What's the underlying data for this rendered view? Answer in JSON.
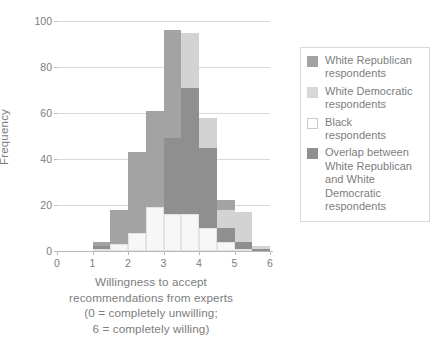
{
  "chart_data": {
    "type": "bar",
    "title": "",
    "subtitle": "",
    "xlabel": "Willingness to accept recommendations from experts (0 = completely unwilling; 6 = completely willing)",
    "ylabel": "Frequency",
    "xlim": [
      0,
      6
    ],
    "ylim": [
      0,
      100
    ],
    "xticks": [
      "0",
      "1",
      "2",
      "3",
      "4",
      "5",
      "6"
    ],
    "yticks": [
      "0",
      "20",
      "40",
      "60",
      "80",
      "100"
    ],
    "grid": true,
    "legend_position": "right",
    "bin_width": 0.5,
    "bin_starts": [
      1.0,
      1.5,
      2.0,
      2.5,
      3.0,
      3.5,
      4.0,
      4.5,
      5.0,
      5.5
    ],
    "series": [
      {
        "name": "White Republican respondents",
        "color": "#a3a3a3",
        "values": [
          4,
          18,
          43,
          61,
          96,
          71,
          58,
          22,
          4,
          1
        ]
      },
      {
        "name": "White Democratic respondents",
        "color": "#d3d3d3",
        "values": [
          2,
          3,
          8,
          19,
          49,
          95,
          58,
          18,
          17,
          2
        ]
      },
      {
        "name": "Black respondents",
        "color": "#f7f7f7",
        "values": [
          1,
          3,
          8,
          19,
          16,
          16,
          10,
          4,
          1,
          0
        ]
      },
      {
        "name": "Overlap between White Republican and White Democratic respondents",
        "color": "#8f8f8f",
        "values": [
          2,
          3,
          8,
          19,
          49,
          71,
          45,
          10,
          4,
          1
        ]
      }
    ]
  },
  "axes": {
    "y_title": "Frequency",
    "y_ticks": [
      {
        "label": "100",
        "value": 100
      },
      {
        "label": "80",
        "value": 80
      },
      {
        "label": "60",
        "value": 60
      },
      {
        "label": "40",
        "value": 40
      },
      {
        "label": "20",
        "value": 20
      },
      {
        "label": "0",
        "value": 0
      }
    ],
    "x_ticks": [
      {
        "label": "0",
        "value": 0
      },
      {
        "label": "1",
        "value": 1
      },
      {
        "label": "2",
        "value": 2
      },
      {
        "label": "3",
        "value": 3
      },
      {
        "label": "4",
        "value": 4
      },
      {
        "label": "5",
        "value": 5
      },
      {
        "label": "6",
        "value": 6
      }
    ],
    "x_caption_lines": [
      "Willingness to accept",
      "recommendations from experts",
      "(0 = completely unwilling;",
      "6 = completely willing)"
    ]
  },
  "legend": {
    "items": [
      {
        "swatch_color": "#a3a3a3",
        "swatch_border": "#a3a3a3",
        "lines": [
          "White Republican",
          "respondents"
        ]
      },
      {
        "swatch_color": "#d8d8d8",
        "swatch_border": "#d8d8d8",
        "lines": [
          "White Democratic",
          "respondents"
        ]
      },
      {
        "swatch_color": "#ffffff",
        "swatch_border": "#c9c9c9",
        "lines": [
          "Black",
          "respondents"
        ]
      },
      {
        "swatch_color": "#909090",
        "swatch_border": "#909090",
        "lines": [
          "Overlap between",
          "White Republican",
          "and White",
          "Democratic",
          "respondents"
        ]
      }
    ]
  },
  "colors": {
    "white_republican": "#a3a3a3",
    "white_democratic": "#d3d3d3",
    "black_respondents": "#f7f7f7",
    "overlap": "#8f8f8f",
    "gridline": "#d8d8d8",
    "axis": "#b9b9b9",
    "text": "#7d7d7d",
    "background": "#ffffff"
  }
}
